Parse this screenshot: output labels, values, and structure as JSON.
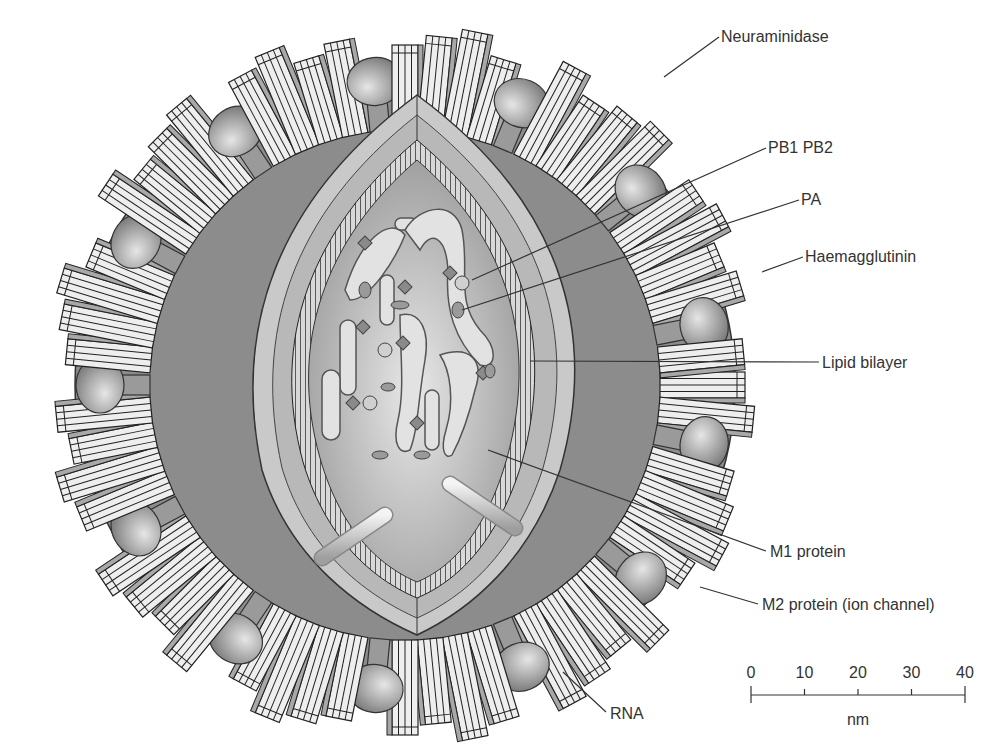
{
  "diagram": {
    "labels": [
      {
        "id": "neuraminidase",
        "text": "Neuraminidase",
        "x": 721,
        "y": 42,
        "line": [
          719,
          37,
          664,
          77
        ]
      },
      {
        "id": "pb1-pb2",
        "text": "PB1 PB2",
        "x": 768,
        "y": 153,
        "line": [
          766,
          148,
          472,
          280
        ]
      },
      {
        "id": "pa",
        "text": "PA",
        "x": 801,
        "y": 205,
        "line": [
          799,
          200,
          462,
          310
        ]
      },
      {
        "id": "haemagglutinin",
        "text": "Haemagglutinin",
        "x": 805,
        "y": 262,
        "line": [
          803,
          257,
          762,
          272
        ]
      },
      {
        "id": "lipid-bilayer",
        "text": "Lipid bilayer",
        "x": 822,
        "y": 368,
        "line": [
          819,
          362,
          530,
          361
        ]
      },
      {
        "id": "m1-protein",
        "text": "M1 protein",
        "x": 770,
        "y": 557,
        "line": [
          766,
          551,
          488,
          450
        ]
      },
      {
        "id": "m2-protein",
        "text": "M2 protein (ion channel)",
        "x": 762,
        "y": 610,
        "line": [
          758,
          604,
          700,
          587
        ]
      },
      {
        "id": "rna",
        "text": "RNA",
        "x": 610,
        "y": 719,
        "line": [
          606,
          712,
          563,
          672
        ]
      }
    ]
  },
  "scale_bar": {
    "ticks": [
      "0",
      "10",
      "20",
      "30",
      "40"
    ],
    "unit": "nm"
  },
  "colors": {
    "envelope": "#8c8c8c",
    "membrane_light": "#c8c8c8",
    "interior": "#b5b5b5",
    "spike": "#eeeeee",
    "spike_shade": "#a8a8a8",
    "knob": "#9a9a9a",
    "outline": "#222222",
    "text": "#333333"
  }
}
